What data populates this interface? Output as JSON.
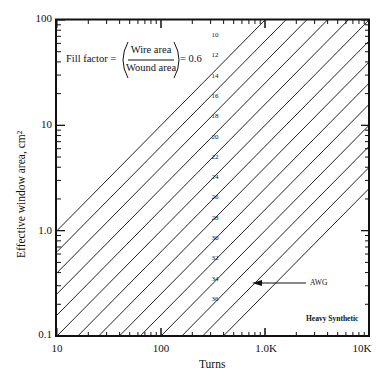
{
  "chart_data": {
    "type": "line",
    "title": "",
    "xlabel": "Turns",
    "ylabel": "Effective window area, cm²",
    "xscale": "log",
    "yscale": "log",
    "xlim": [
      10,
      10000
    ],
    "ylim": [
      0.1,
      100
    ],
    "x_tick_labels": [
      "10",
      "100",
      "1.0K",
      "10K"
    ],
    "y_tick_labels": [
      "100",
      "10",
      "1.0",
      "0.1"
    ],
    "grid": false,
    "legend": null,
    "annotations": {
      "formula_left": "Fill factor =",
      "formula_numerator": "Wire area",
      "formula_denominator": "Wound area",
      "formula_right": "= 0.6",
      "arrow_label": "AWG",
      "material_label": "Heavy Synthetic"
    },
    "relationship": "log10(area) = log10(turns) - 1 - 0.2*k, k = gauge index (0 for AWG 10)",
    "series": [
      {
        "name": "10",
        "points": [
          [
            10,
            1.0
          ],
          [
            1000,
            100
          ]
        ]
      },
      {
        "name": "12",
        "points": [
          [
            10,
            0.631
          ],
          [
            1585,
            100
          ]
        ]
      },
      {
        "name": "14",
        "points": [
          [
            10,
            0.398
          ],
          [
            2512,
            100
          ]
        ]
      },
      {
        "name": "16",
        "points": [
          [
            10,
            0.251
          ],
          [
            3981,
            100
          ]
        ]
      },
      {
        "name": "18",
        "points": [
          [
            10,
            0.158
          ],
          [
            6310,
            100
          ]
        ]
      },
      {
        "name": "20",
        "points": [
          [
            10,
            0.1
          ],
          [
            10000,
            100
          ]
        ]
      },
      {
        "name": "22",
        "points": [
          [
            15.85,
            0.1
          ],
          [
            10000,
            63.1
          ]
        ]
      },
      {
        "name": "24",
        "points": [
          [
            25.12,
            0.1
          ],
          [
            10000,
            39.8
          ]
        ]
      },
      {
        "name": "26",
        "points": [
          [
            39.81,
            0.1
          ],
          [
            10000,
            25.1
          ]
        ]
      },
      {
        "name": "28",
        "points": [
          [
            63.1,
            0.1
          ],
          [
            10000,
            15.8
          ]
        ]
      },
      {
        "name": "30",
        "points": [
          [
            100,
            0.1
          ],
          [
            10000,
            10
          ]
        ]
      },
      {
        "name": "32",
        "points": [
          [
            158.5,
            0.1
          ],
          [
            10000,
            6.31
          ]
        ]
      },
      {
        "name": "34",
        "points": [
          [
            251.2,
            0.1
          ],
          [
            10000,
            3.98
          ]
        ]
      },
      {
        "name": "36",
        "points": [
          [
            398.1,
            0.1
          ],
          [
            10000,
            2.51
          ]
        ]
      }
    ]
  }
}
